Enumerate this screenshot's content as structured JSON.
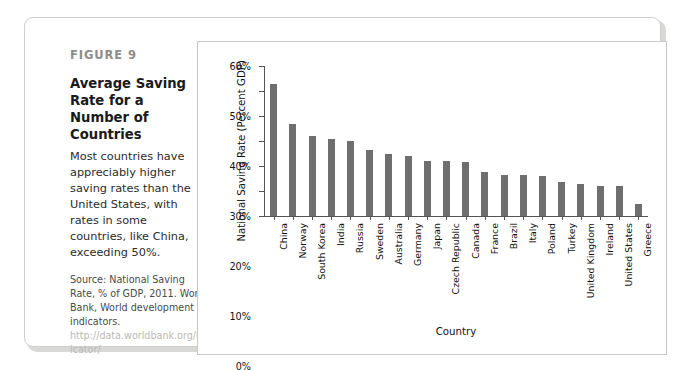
{
  "figure": {
    "label": "FIGURE 9",
    "title": "Average Saving Rate for a Number of Countries",
    "description": "Most countries have appreciably higher saving rates than the United States, with rates in some countries, like China, exceeding 50%.",
    "source_text": "Source: National Saving Rate, % of GDP, 2011. World Bank, World development indicators.",
    "source_url": "http://data.worldbank.org/indicator/"
  },
  "chart_data": {
    "type": "bar",
    "title": "",
    "xlabel": "Country",
    "ylabel": "National Saving Rate (Percent GDP)",
    "ylim": [
      0,
      60
    ],
    "ytick_labels": [
      "0%",
      "10%",
      "20%",
      "30%",
      "40%",
      "50%",
      "60%"
    ],
    "ytick_values": [
      0,
      10,
      20,
      30,
      40,
      50,
      60
    ],
    "grid": false,
    "legend": false,
    "bar_color": "#6e6e6e",
    "categories": [
      "China",
      "Norway",
      "South Korea",
      "India",
      "Russia",
      "Sweden",
      "Australia",
      "Germany",
      "Japan",
      "Czech Republic",
      "Canada",
      "France",
      "Brazil",
      "Italy",
      "Poland",
      "Turkey",
      "United Kingdom",
      "Ireland",
      "United States",
      "Greece"
    ],
    "values": [
      53,
      37,
      32,
      31,
      30,
      26.5,
      25,
      24,
      22,
      22,
      21.5,
      17.5,
      16.5,
      16.5,
      16,
      13.5,
      13,
      12,
      12,
      5
    ]
  }
}
